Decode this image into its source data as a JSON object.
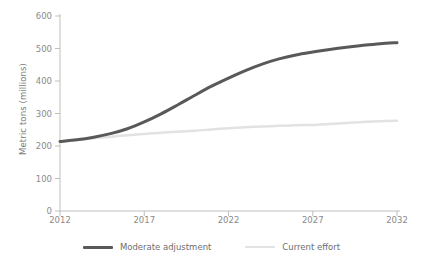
{
  "chart_data": {
    "type": "line",
    "title": "",
    "xlabel": "",
    "ylabel": "Metric tons (millions)",
    "xlim": [
      2012,
      2032
    ],
    "ylim": [
      0,
      600
    ],
    "xticks": [
      2012,
      2017,
      2022,
      2027,
      2032
    ],
    "yticks": [
      0,
      100,
      200,
      300,
      400,
      500,
      600
    ],
    "grid": false,
    "legend_position": "bottom-center",
    "x": [
      2012,
      2013,
      2014,
      2015,
      2016,
      2017,
      2018,
      2019,
      2020,
      2021,
      2022,
      2023,
      2024,
      2025,
      2026,
      2027,
      2028,
      2029,
      2030,
      2031,
      2032
    ],
    "series": [
      {
        "name": "Moderate adjustment",
        "color": "#595959",
        "width": 3,
        "values": [
          214,
          219,
          227,
          238,
          253,
          274,
          299,
          327,
          356,
          384,
          409,
          432,
          452,
          468,
          480,
          489,
          497,
          504,
          510,
          515,
          518
        ]
      },
      {
        "name": "Current effort",
        "color": "#e2e2e2",
        "width": 2.5,
        "values": [
          214,
          219,
          224,
          228,
          233,
          237,
          241,
          244,
          247,
          251,
          255,
          258,
          260,
          262,
          264,
          265,
          268,
          271,
          274,
          276,
          278
        ]
      }
    ]
  },
  "axes": {
    "y_title": "Metric tons (millions)",
    "y_tick_labels": [
      "600",
      "500",
      "400",
      "300",
      "200",
      "100",
      "0"
    ],
    "x_tick_labels": [
      "2012",
      "2017",
      "2022",
      "2027",
      "2032"
    ],
    "axis_color": "#bfbfbf",
    "tick_text_color": "#8a8a8a"
  },
  "legend": {
    "items": [
      {
        "label": "Moderate adjustment",
        "color": "#595959"
      },
      {
        "label": "Current effort",
        "color": "#e2e2e2"
      }
    ]
  }
}
